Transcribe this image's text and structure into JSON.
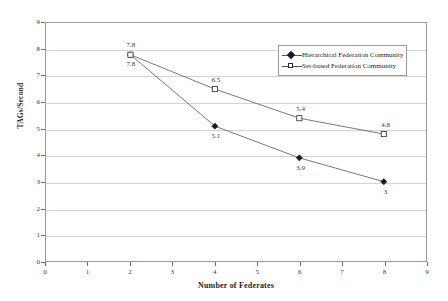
{
  "chart_data": {
    "type": "line",
    "title": "",
    "xlabel": "Number of Federates",
    "ylabel": "TAGs/Second",
    "xlim": [
      0,
      9
    ],
    "ylim": [
      0,
      9
    ],
    "xticks": [
      0,
      1,
      2,
      3,
      4,
      5,
      6,
      7,
      8,
      9
    ],
    "yticks": [
      0,
      1,
      2,
      3,
      4,
      5,
      6,
      7,
      8,
      9
    ],
    "grid": "horizontal",
    "legend_position": "top-right-inside",
    "x": [
      2,
      4,
      6,
      8
    ],
    "series": [
      {
        "name": "Hierarchical Federation Community",
        "marker": "filled-diamond",
        "values": [
          7.8,
          5.1,
          3.9,
          3
        ],
        "labels": [
          "7.8",
          "5.1",
          "3.9",
          "3"
        ],
        "label_position": "below"
      },
      {
        "name": "Set-based Federation Community",
        "marker": "open-square",
        "values": [
          7.8,
          6.5,
          5.4,
          4.8
        ],
        "labels": [
          "7.8",
          "6.5",
          "5.4",
          "4.8"
        ],
        "label_position": "above"
      }
    ],
    "colors": {
      "line": "#555555",
      "marker_fill": "#1a1a1a",
      "marker_open_fill": "#ffffff",
      "gridline": "#d4d4d4",
      "axis": "#9a9a9a",
      "text": "#2b2b2b",
      "background": "#ffffff"
    }
  },
  "axis": {
    "y_tick_labels": [
      "9",
      "8",
      "7",
      "6",
      "5",
      "4",
      "3",
      "2",
      "1",
      "0"
    ],
    "x_tick_labels": [
      "0",
      "1",
      "2",
      "3",
      "4",
      "5",
      "6",
      "7",
      "8",
      "9"
    ],
    "y_title": "TAGs/Second",
    "x_title": "Number of Federates"
  },
  "legend": {
    "items": [
      {
        "label": "Hierarchical Federation Community",
        "marker": "filled-diamond"
      },
      {
        "label": "Set-based Federation Community",
        "marker": "open-square"
      }
    ]
  }
}
